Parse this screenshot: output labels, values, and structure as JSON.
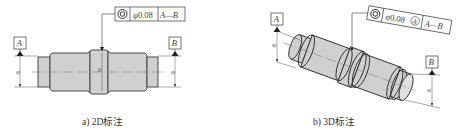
{
  "figure_2d": {
    "caption": "a) 2D标注",
    "frame": {
      "symbol": "concentricity-icon",
      "tolerance": "φ0.08",
      "datum_ref": "A—B"
    },
    "datum_a": "A",
    "datum_b": "B",
    "dia_mark": "φ"
  },
  "figure_3d": {
    "caption": "b) 3D标注",
    "frame": {
      "symbol": "concentricity-icon",
      "tolerance": "φ0.08",
      "modifier": "A",
      "datum_ref": "A—B"
    },
    "datum_a": "A",
    "datum_b": "B",
    "dia_mark": "φ"
  },
  "colors": {
    "shaft_fill": "#d0d0d0",
    "line": "#3a3a3a",
    "datum_triangle": "#1a1a1a"
  }
}
